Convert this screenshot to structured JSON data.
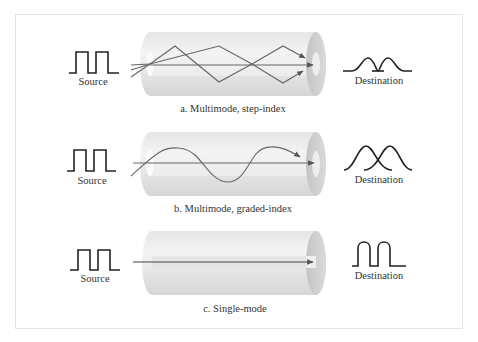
{
  "figure": {
    "panels": [
      {
        "id": "a",
        "caption": "a.  Multimode, step-index",
        "source_label": "Source",
        "destination_label": "Destination",
        "propagation": "zigzag-reflection",
        "output_shape": "broadened-overlapping-pulses"
      },
      {
        "id": "b",
        "caption": "b.  Multimode, graded-index",
        "source_label": "Source",
        "destination_label": "Destination",
        "propagation": "sinusoidal-curve",
        "output_shape": "overlapping-gaussian-pulses"
      },
      {
        "id": "c",
        "caption": "c.  Single-mode",
        "source_label": "Source",
        "destination_label": "Destination",
        "propagation": "straight-line",
        "output_shape": "near-square-pulses"
      }
    ],
    "colors": {
      "line": "#222222",
      "ray": "#666666",
      "cladding": "#dcdcdc",
      "core": "#ececec",
      "frame_border": "#e4e4e4"
    }
  }
}
